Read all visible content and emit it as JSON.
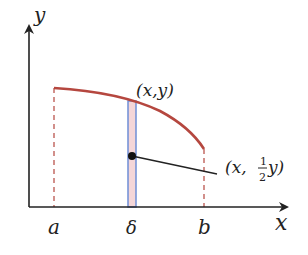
{
  "diagram": {
    "axes": {
      "x_label": "x",
      "y_label": "y"
    },
    "ticks": {
      "a": "a",
      "delta": "δ",
      "b": "b"
    },
    "labels": {
      "point_top": "(x,y)",
      "point_mid_prefix": "(x, ",
      "frac_num": "1",
      "frac_den": "2",
      "point_mid_suffix": "y)"
    },
    "colors": {
      "curve": "#b5473f",
      "dashed": "#b5473f",
      "strip_border": "#6f8fd6",
      "strip_fill": "#f4d6d8",
      "axis": "#222222"
    }
  }
}
